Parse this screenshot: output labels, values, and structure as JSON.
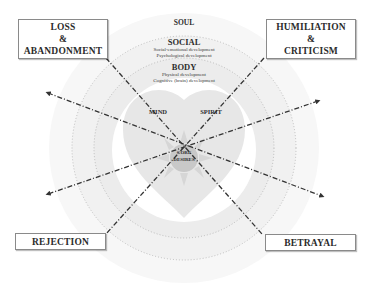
{
  "wound_boxes": {
    "top_left": {
      "lines": [
        "LOSS",
        "&",
        "ABANDONMENT"
      ]
    },
    "top_right": {
      "lines": [
        "HUMILIATION",
        "&",
        "CRITICISM"
      ]
    },
    "bottom_left": {
      "lines": [
        "REJECTION"
      ]
    },
    "bottom_right": {
      "lines": [
        "BETRAYAL"
      ]
    }
  },
  "rings": {
    "soul": {
      "title": "SOUL"
    },
    "social": {
      "title": "SOCIAL",
      "items": [
        "Social-emotional development",
        "Psychological development"
      ]
    },
    "body": {
      "title": "BODY",
      "items": [
        "Physical development",
        "Cognitive (brain) development"
      ]
    }
  },
  "inner": {
    "mind": "MIND",
    "spirit": "SPIRIT",
    "core": [
      "CORE",
      "DESIRES"
    ]
  },
  "colors": {
    "ring_outer": "#f6f6f6",
    "ring_mid": "#efefef",
    "ring_inner": "#e9e9e9",
    "heart": "#e6e6e6",
    "core": "#c9c9c9",
    "rays": "#d8d8d8",
    "line": "#333333"
  }
}
